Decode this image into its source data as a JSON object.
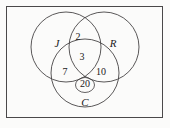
{
  "figure": {
    "type": "venn-diagram-3-set",
    "universe_label": "",
    "background_color": "#fbfbfa",
    "line_color": "#3c3a3b",
    "text_color": "#222021",
    "sets": [
      {
        "id": "J",
        "label": "J",
        "label_x": 57,
        "label_y": 44,
        "cx": 66,
        "cy": 47,
        "r": 35
      },
      {
        "id": "R",
        "label": "R",
        "label_x": 113,
        "label_y": 44,
        "cx": 104,
        "cy": 47,
        "r": 35
      },
      {
        "id": "C",
        "label": "C",
        "label_x": 85,
        "label_y": 103,
        "cx": 85,
        "cy": 73,
        "r": 34
      }
    ],
    "regions": [
      {
        "id": "J-and-R-only",
        "value": "2",
        "x": 78,
        "y": 38
      },
      {
        "id": "J-and-R-and-C",
        "value": "3",
        "x": 82,
        "y": 58
      },
      {
        "id": "J-and-C-only",
        "value": "7",
        "x": 65,
        "y": 73
      },
      {
        "id": "R-and-C-only",
        "value": "10",
        "x": 101,
        "y": 73
      },
      {
        "id": "C-only",
        "value": "20",
        "x": 85,
        "y": 88,
        "highlighted": true
      }
    ],
    "highlight": {
      "region_id": "C-only",
      "shape": "ellipse",
      "cx": 85,
      "cy": 85,
      "rx": 9.5,
      "ry": 7.5
    },
    "universe_box": {
      "x": 6,
      "y": 6,
      "width": 157,
      "height": 112
    }
  }
}
